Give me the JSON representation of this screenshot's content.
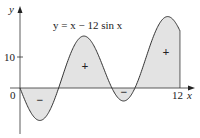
{
  "chart_data": {
    "type": "area",
    "title": "y = x − 12 sin x",
    "equation": "y = x − 12 sin x",
    "xlabel": "x",
    "ylabel": "y",
    "xlim": [
      0,
      12
    ],
    "ylim": [
      -12,
      25
    ],
    "x_ticks": [
      {
        "value": 0,
        "label": "0"
      },
      {
        "value": 12,
        "label": "12"
      }
    ],
    "y_ticks": [
      {
        "value": 10,
        "label": "10"
      }
    ],
    "grid": false,
    "legend": null,
    "series": [
      {
        "name": "y = x − 12 sin x",
        "x": [
          0,
          1,
          1.4,
          2,
          2.7,
          3,
          4,
          4.6,
          5,
          6,
          6.4,
          7,
          7.8,
          8,
          8.6,
          9,
          10,
          10.9,
          11,
          12
        ],
        "values": [
          0,
          -9.1,
          -10.4,
          -8.9,
          -2.6,
          1.3,
          13.1,
          16.5,
          16.5,
          9.4,
          4.5,
          -0.9,
          -4.1,
          -3.9,
          -0.4,
          4.1,
          16.5,
          22.0,
          23.0,
          18.4
        ]
      }
    ],
    "shaded_region": {
      "from": 0,
      "to": 12,
      "fill": "#e3e3e3"
    },
    "region_signs": [
      {
        "x": 1.4,
        "y": -4,
        "label": "−"
      },
      {
        "x": 4.6,
        "y": 7,
        "label": "+"
      },
      {
        "x": 7.7,
        "y": -1.2,
        "label": "−"
      },
      {
        "x": 10.9,
        "y": 11,
        "label": "+"
      }
    ]
  },
  "colors": {
    "fill": "#e3e3e3",
    "line": "#333333",
    "axis": "#333333"
  }
}
